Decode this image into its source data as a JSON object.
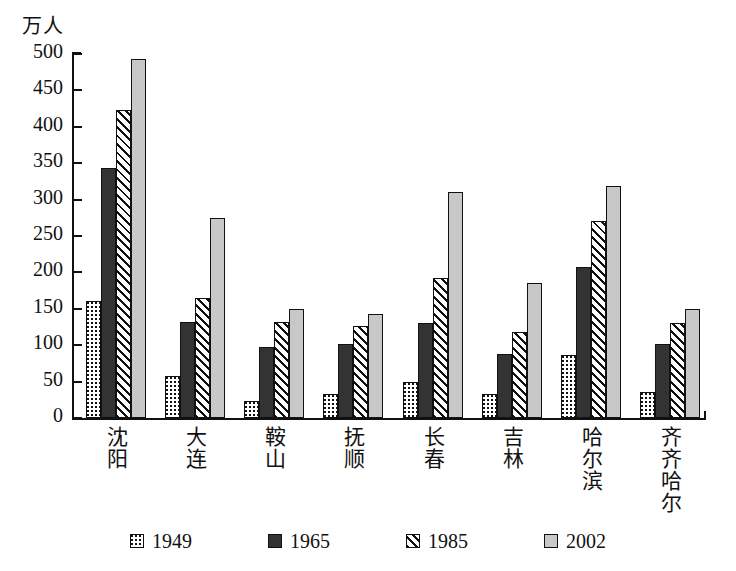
{
  "chart_data": {
    "type": "bar",
    "title": "",
    "subtitle": "",
    "unit_caption": "万人",
    "xlabel": "",
    "ylabel": "万人",
    "ylim": [
      0,
      500
    ],
    "yticks": [
      500,
      450,
      400,
      350,
      300,
      250,
      200,
      150,
      100,
      50,
      0
    ],
    "grid": false,
    "legend_position": "bottom",
    "categories": [
      "沈阳",
      "大连",
      "鞍山",
      "抚顺",
      "长春",
      "吉林",
      "哈尔滨",
      "齐齐哈尔"
    ],
    "series": [
      {
        "name": "1949",
        "fill": "dotted",
        "color": "#ffffff",
        "values": [
          161,
          58,
          23,
          33,
          50,
          33,
          87,
          36
        ]
      },
      {
        "name": "1965",
        "fill": "solid-dark",
        "color": "#333333",
        "values": [
          343,
          132,
          98,
          102,
          131,
          88,
          207,
          102
        ]
      },
      {
        "name": "1985",
        "fill": "diagonal-hatch",
        "color": "#ffffff",
        "values": [
          423,
          165,
          132,
          127,
          192,
          118,
          271,
          131
        ]
      },
      {
        "name": "2002",
        "fill": "solid-light",
        "color": "#c8c8c8",
        "values": [
          493,
          275,
          150,
          143,
          311,
          186,
          319,
          150
        ]
      }
    ]
  },
  "axis": {
    "outline_color": "#111111"
  }
}
